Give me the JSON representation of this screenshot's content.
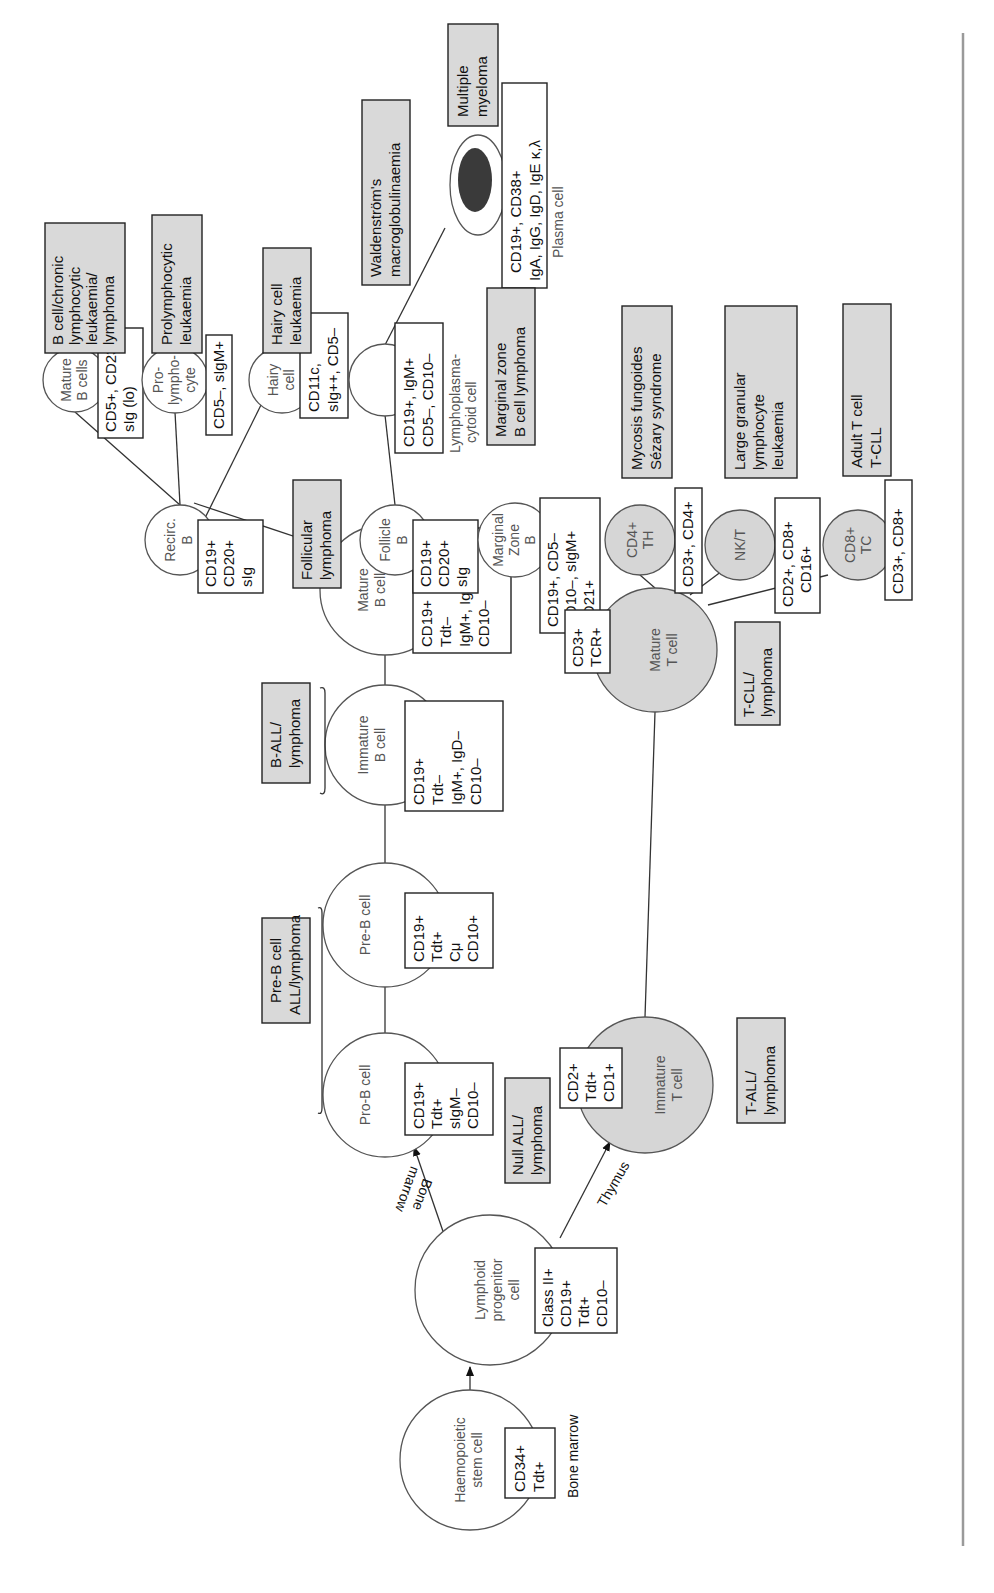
{
  "figure": {
    "orientation": "rotated 90 degrees counter-clockwise",
    "colors": {
      "b_cell_fill": "#ffffff",
      "t_cell_fill": "#d6d6d6",
      "disease_box_fill": "#d9d9d9",
      "plasma_nucleus": "#3a3a3a",
      "right_rule": "#9a9a9a"
    }
  },
  "cells": {
    "stem": {
      "label": [
        "Haemopoietic",
        "stem cell"
      ],
      "markers": [
        "CD34+",
        "Tdt+"
      ],
      "note": "Bone marrow"
    },
    "lymphoid_progenitor": {
      "label": [
        "Lymphoid",
        "progenitor",
        "cell"
      ],
      "markers": [
        "Class II+",
        "CD19+",
        "Tdt+",
        "CD10–"
      ]
    },
    "pro_b": {
      "label": [
        "Pro-B cell"
      ],
      "markers": [
        "CD19+",
        "Tdt+",
        "sIgM–",
        "CD10–"
      ]
    },
    "pre_b": {
      "label": [
        "Pre-B cell"
      ],
      "markers": [
        "CD19+",
        "Tdt+",
        "Cμ",
        "CD10+"
      ]
    },
    "immature_b": {
      "label": [
        "Immature",
        "B cell"
      ],
      "markers": [
        "CD19+",
        "Tdt–",
        "IgM+, IgD–",
        "CD10–"
      ]
    },
    "mature_b": {
      "label": [
        "Mature",
        "B cell"
      ],
      "markers": [
        "CD19+",
        "Tdt–",
        "IgM+, IgD–",
        "CD10–"
      ]
    },
    "recirc_b": {
      "label": [
        "Recirc.",
        "B"
      ],
      "markers": [
        "CD19+",
        "CD20+",
        "sIg"
      ]
    },
    "follicle_b": {
      "label": [
        "Follicle",
        "B"
      ],
      "markers": [
        "CD19+",
        "CD20+",
        "sIg"
      ]
    },
    "marginal_zone_b": {
      "label": [
        "Marginal",
        "Zone",
        "B"
      ],
      "markers": [
        "CD19+, CD5–",
        "CD10–, sIgM+",
        "CD21+"
      ]
    },
    "mature_b_cells": {
      "label": [
        "Mature",
        "B cells"
      ],
      "markers": [
        "CD5+, CD23+",
        "sIg (lo)"
      ]
    },
    "prolymphocyte": {
      "label": [
        "Pro-",
        "lympho-",
        "cyte"
      ],
      "markers": [
        "CD5–, sIgM+"
      ]
    },
    "hairy_cell": {
      "label": [
        "Hairy",
        "cell"
      ],
      "markers": [
        "CD11c,",
        "sIg++, CD5–"
      ]
    },
    "lymphoplasmacytoid": {
      "label": [
        "Lymphoplasma-",
        "cytoid cell"
      ],
      "markers": [
        "CD19+, IgM+",
        "CD5–, CD10–"
      ]
    },
    "plasma": {
      "label": [
        "Plasma cell"
      ],
      "markers": [
        "CD19+, CD38+",
        "IgA, IgG, IgD, IgE κ,λ"
      ]
    },
    "immature_t": {
      "label": [
        "Immature",
        "T cell"
      ],
      "markers": [
        "CD2+",
        "Tdt+",
        "CD1+"
      ]
    },
    "mature_t": {
      "label": [
        "Mature",
        "T cell"
      ],
      "markers": [
        "CD3+",
        "TCR+"
      ]
    },
    "cd4_th": {
      "label": [
        "CD4+",
        "TH"
      ],
      "markers": [
        "CD3+, CD4+"
      ]
    },
    "nk_t": {
      "label": [
        "NK/T"
      ],
      "markers": [
        "CD2+, CD8+",
        "CD16+"
      ]
    },
    "cd8_tc": {
      "label": [
        "CD8+",
        "TC"
      ],
      "markers": [
        "CD3+, CD8+"
      ]
    }
  },
  "arrows": {
    "bone_marrow": [
      "Bone",
      "marrow"
    ],
    "thymus": "Thymus"
  },
  "diseases": {
    "null_all": [
      "Null ALL/",
      "lymphoma"
    ],
    "pre_b_all": [
      "Pre-B cell",
      "ALL/lymphoma"
    ],
    "b_all": [
      "B-ALL/",
      "lymphoma"
    ],
    "follicular": [
      "Follicular",
      "lymphoma"
    ],
    "b_cll": [
      "B cell/chronic",
      "lymphocytic",
      "leukaemia/",
      "lymphoma"
    ],
    "prolymphocytic": [
      "Prolymphocytic",
      "leukaemia"
    ],
    "hairy_cell_leukaemia": [
      "Hairy cell",
      "leukaemia"
    ],
    "waldenstrom": [
      "Waldenström's",
      "macroglobulinaemia"
    ],
    "multiple_myeloma": [
      "Multiple",
      "myeloma"
    ],
    "marginal_zone_lymphoma": [
      "Marginal zone",
      "B cell lymphoma"
    ],
    "t_all": [
      "T-ALL/",
      "lymphoma"
    ],
    "t_cll": [
      "T-CLL/",
      "lymphoma"
    ],
    "mycosis": [
      "Mycosis fungoides",
      "Sézary syndrome"
    ],
    "lgl": [
      "Large granular",
      "lymphocyte",
      "leukaemia"
    ],
    "adult_t": [
      "Adult T cell",
      "T-CLL"
    ]
  }
}
